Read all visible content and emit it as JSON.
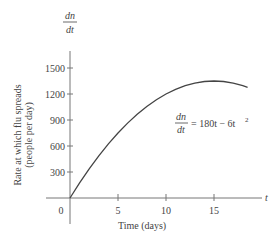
{
  "chart_data": {
    "type": "line",
    "title": "",
    "equation": {
      "lhs_num": "dn",
      "lhs_den": "dt",
      "rhs": "= 180t − 6t",
      "exponent": "2"
    },
    "y_axis_symbol": {
      "num": "dn",
      "den": "dt"
    },
    "x_axis_symbol": "t",
    "xlabel": "Time (days)",
    "ylabel_line1": "Rate at which flu spreads",
    "ylabel_line2": "(people per day)",
    "xlim": [
      0,
      20
    ],
    "ylim": [
      0,
      1800
    ],
    "x_ticks": [
      0,
      5,
      10,
      15
    ],
    "x_tick_labels": [
      "0",
      "5",
      "10",
      "15"
    ],
    "y_ticks": [
      300,
      600,
      900,
      1200,
      1500
    ],
    "y_tick_labels": [
      "300",
      "600",
      "900",
      "1200",
      "1500"
    ],
    "grid": false,
    "series": [
      {
        "name": "dn/dt = 180t - 6t^2",
        "function": "180t - 6t^2",
        "x": [
          0,
          1,
          2,
          3,
          4,
          5,
          6,
          7,
          8,
          9,
          10,
          11,
          12,
          13,
          14,
          15,
          16,
          17,
          18,
          18.5
        ],
        "y": [
          0,
          174,
          336,
          486,
          624,
          750,
          864,
          966,
          1056,
          1134,
          1200,
          1254,
          1296,
          1326,
          1344,
          1350,
          1344,
          1326,
          1296,
          1276.5
        ]
      }
    ]
  }
}
